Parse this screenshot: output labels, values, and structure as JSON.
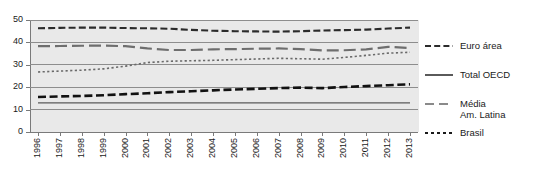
{
  "chart_data": {
    "type": "line",
    "title": "",
    "xlabel": "",
    "ylabel": "",
    "ylim": [
      0,
      50
    ],
    "yticks": [
      0,
      10,
      20,
      30,
      40,
      50
    ],
    "grid": true,
    "legend_position": "right",
    "categories": [
      "1996",
      "1997",
      "1998",
      "1999",
      "2000",
      "2001",
      "2002",
      "2003",
      "2004",
      "2005",
      "2006",
      "2007",
      "2008",
      "2009",
      "2010",
      "2011",
      "2012",
      "2013"
    ],
    "series": [
      {
        "name": "Euro área",
        "style": "dashed",
        "color": "#2b2b2b",
        "width": 2.1,
        "dash": "7,3.2",
        "values": [
          46.3,
          46.5,
          46.6,
          46.6,
          46.4,
          46.3,
          46.1,
          45.6,
          45.2,
          45.0,
          44.9,
          44.8,
          45.0,
          45.3,
          45.5,
          45.7,
          46.2,
          46.6
        ]
      },
      {
        "name": "Total OECD",
        "style": "solid",
        "color": "#5a5a5a",
        "width": 1.1,
        "dash": "",
        "values": [
          13.0,
          13.0,
          13.0,
          13.0,
          13.0,
          13.0,
          13.0,
          13.0,
          13.0,
          13.0,
          13.0,
          13.0,
          13.0,
          13.0,
          13.0,
          13.0,
          13.0,
          13.0
        ]
      },
      {
        "name": "Média\nAm. Latina",
        "style": "long-dash",
        "color": "#6e6e6e",
        "width": 2.2,
        "dash": "12,5",
        "values": [
          38.3,
          38.4,
          38.5,
          38.6,
          38.3,
          37.3,
          36.6,
          36.6,
          36.9,
          37.0,
          37.2,
          37.3,
          37.0,
          36.4,
          36.5,
          36.9,
          38.0,
          37.5
        ]
      },
      {
        "name": "Brasil",
        "style": "dotted",
        "color": "#6a6a6a",
        "width": 1.6,
        "dash": "2.2,2.4",
        "values": [
          26.8,
          27.2,
          27.6,
          28.2,
          29.4,
          31.0,
          31.6,
          31.8,
          32.0,
          32.3,
          32.6,
          32.9,
          32.7,
          32.5,
          33.3,
          34.2,
          35.2,
          35.6
        ]
      },
      {
        "name": "Brasil-carga",
        "style": "bold-dash",
        "color": "#111111",
        "width": 2.6,
        "dash": "8,3.6",
        "values": [
          15.6,
          15.9,
          16.1,
          16.4,
          16.9,
          17.3,
          17.8,
          18.2,
          18.6,
          19.0,
          19.3,
          19.6,
          19.8,
          19.6,
          20.1,
          20.5,
          20.9,
          21.3
        ]
      }
    ],
    "legend": [
      {
        "label": "Euro área",
        "style": "dashed",
        "color": "#2b2b2b",
        "dash": "6,3.2",
        "width": 2.2
      },
      {
        "label": "Total OECD",
        "style": "solid",
        "color": "#5a5a5a",
        "dash": "",
        "width": 2.0
      },
      {
        "label": "Média\nAm. Latina",
        "style": "long-dash",
        "color": "#8a8a8a",
        "dash": "9,5",
        "width": 2.2
      },
      {
        "label": "Brasil",
        "style": "dotted",
        "color": "#1a1a1a",
        "dash": "3,3",
        "width": 2.2
      }
    ]
  }
}
